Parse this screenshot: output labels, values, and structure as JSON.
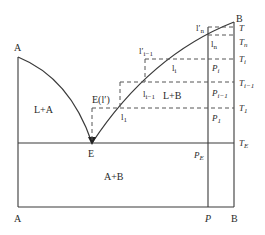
{
  "diagram": {
    "type": "binary eutectic phase diagram",
    "components": {
      "left": "A",
      "right": "B"
    },
    "axis_labels": {
      "top_left": "A",
      "top_right": "B",
      "bottom_left": "A",
      "bottom_p": "P",
      "bottom_right": "B"
    },
    "regions": {
      "liquid_plus_A": "L+A",
      "liquid_plus_B": "L+B",
      "solid": "A+B"
    },
    "eutectic": {
      "point_label": "E",
      "upper_label": "E(l′)",
      "temperature_label": "T",
      "temperature_sub": "E",
      "composition_label": "P",
      "composition_sub": "E"
    },
    "liquidus_points": [
      {
        "label": "l",
        "sub": "1"
      },
      {
        "label": "l",
        "sub": "i−1"
      },
      {
        "label": "l",
        "sub": "i"
      },
      {
        "label": "l",
        "sub": "n"
      },
      {
        "label": "l′",
        "sub": "i−1"
      },
      {
        "label": "l′",
        "sub": "n"
      }
    ],
    "temperatures": [
      {
        "label": "T",
        "sub": ""
      },
      {
        "label": "T",
        "sub": "n"
      },
      {
        "label": "T",
        "sub": "i"
      },
      {
        "label": "T",
        "sub": "i−1"
      },
      {
        "label": "T",
        "sub": "1"
      },
      {
        "label": "T",
        "sub": "E"
      }
    ],
    "compositions": [
      {
        "label": "P",
        "sub": "i"
      },
      {
        "label": "P",
        "sub": "i−1"
      },
      {
        "label": "P",
        "sub": "1"
      },
      {
        "label": "P",
        "sub": "E"
      }
    ]
  }
}
